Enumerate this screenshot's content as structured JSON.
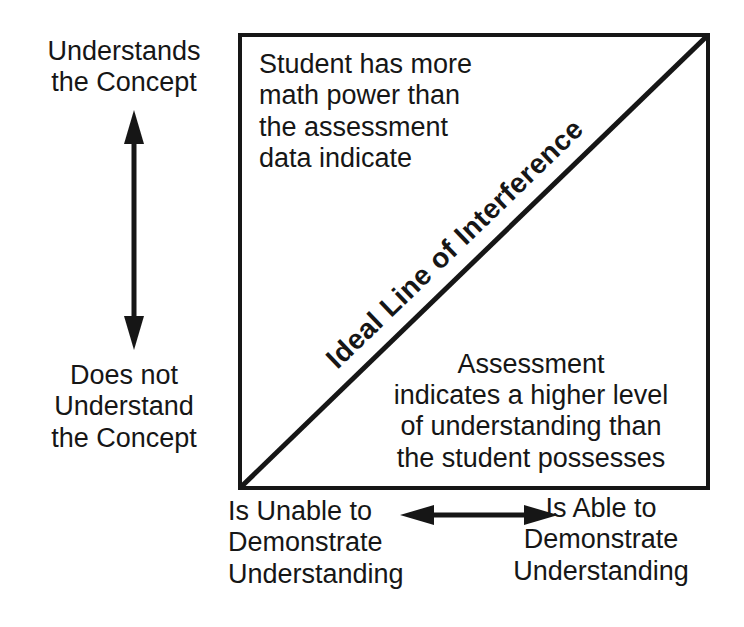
{
  "colors": {
    "ink": "#161616",
    "background": "#ffffff"
  },
  "y_axis": {
    "top_label": "Understands\nthe Concept",
    "bottom_label": "Does not\nUnderstand\nthe Concept"
  },
  "x_axis": {
    "left_label": "Is Unable to\nDemonstrate\nUnderstanding",
    "right_label": "Is Able to\nDemonstrate\nUnderstanding"
  },
  "matrix": {
    "upper_left_text": "Student has more\nmath power than\nthe assessment\ndata indicate",
    "lower_right_text": "Assessment\nindicates a higher level\nof understanding than\nthe student possesses",
    "diagonal_label": "Ideal Line of Interference"
  }
}
